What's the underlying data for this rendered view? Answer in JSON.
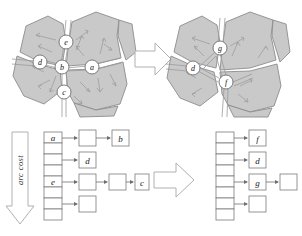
{
  "figure": {
    "panels": {
      "graph_before": {
        "name": "planar-subdivision-before",
        "nodes": [
          {
            "id": "e",
            "label": "e",
            "cx": 66,
            "cy": 42
          },
          {
            "id": "d",
            "label": "d",
            "cx": 40,
            "cy": 62
          },
          {
            "id": "b",
            "label": "b",
            "cx": 62,
            "cy": 67
          },
          {
            "id": "a",
            "label": "a",
            "cx": 92,
            "cy": 67
          },
          {
            "id": "c",
            "label": "c",
            "cx": 64,
            "cy": 92
          }
        ]
      },
      "graph_after": {
        "name": "planar-subdivision-after",
        "nodes": [
          {
            "id": "g",
            "label": "g",
            "cx": 60,
            "cy": 48
          },
          {
            "id": "d",
            "label": "d",
            "cx": 33,
            "cy": 68
          },
          {
            "id": "f",
            "label": "f",
            "cx": 66,
            "cy": 82
          }
        ]
      },
      "list_before": {
        "name": "bucket-list-before",
        "axis_label": "arc cost",
        "bucket_count": 8,
        "rows": [
          {
            "bucket_index": 0,
            "bucket_label": "a",
            "chain": [
              "",
              "b"
            ]
          },
          {
            "bucket_index": 1,
            "bucket_label": "",
            "chain": []
          },
          {
            "bucket_index": 2,
            "bucket_label": "",
            "chain": [
              "d"
            ]
          },
          {
            "bucket_index": 3,
            "bucket_label": "",
            "chain": []
          },
          {
            "bucket_index": 4,
            "bucket_label": "e",
            "chain": [
              "",
              "",
              "c"
            ]
          },
          {
            "bucket_index": 5,
            "bucket_label": "",
            "chain": []
          },
          {
            "bucket_index": 6,
            "bucket_label": "",
            "chain": [
              ""
            ]
          },
          {
            "bucket_index": 7,
            "bucket_label": "",
            "chain": []
          }
        ]
      },
      "list_after": {
        "name": "bucket-list-after",
        "bucket_count": 8,
        "rows": [
          {
            "bucket_index": 0,
            "bucket_label": "",
            "chain": [
              "f"
            ]
          },
          {
            "bucket_index": 1,
            "bucket_label": "",
            "chain": []
          },
          {
            "bucket_index": 2,
            "bucket_label": "",
            "chain": [
              "d"
            ]
          },
          {
            "bucket_index": 3,
            "bucket_label": "",
            "chain": []
          },
          {
            "bucket_index": 4,
            "bucket_label": "",
            "chain": [
              "g",
              ""
            ]
          },
          {
            "bucket_index": 5,
            "bucket_label": "",
            "chain": []
          },
          {
            "bucket_index": 6,
            "bucket_label": "",
            "chain": [
              ""
            ]
          },
          {
            "bucket_index": 7,
            "bucket_label": "",
            "chain": []
          }
        ]
      }
    },
    "transition_arrows": [
      {
        "name": "transition-arrow-top",
        "direction": "right"
      },
      {
        "name": "transition-arrow-bottom",
        "direction": "right"
      }
    ],
    "colors": {
      "background": "#ffffff",
      "polygon_fill": "#c9c9c9",
      "polygon_stroke": "#8c8c8c",
      "node_fill": "#ffffff",
      "node_stroke": "#6e6e6e",
      "edge_stroke": "#9a9a9a",
      "flow_arrow": "#9e9e9e",
      "box_stroke": "#7a7a7a",
      "box_fill": "#ffffff",
      "link_arrow": "#6e6e6e",
      "block_arrow_stroke": "#b0b0b0",
      "text": "#111111"
    }
  }
}
